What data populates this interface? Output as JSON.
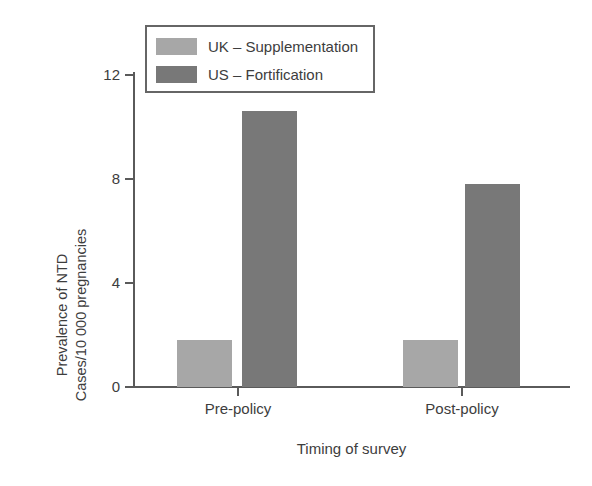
{
  "chart_data": {
    "type": "bar",
    "title": "",
    "xlabel": "Timing of survey",
    "ylabel": "Prevalence of NTD\nCases/10 000 pregnancies",
    "ylabel_line1": "Prevalence of NTD",
    "ylabel_line2": "Cases/10 000 pregnancies",
    "categories": [
      "Pre-policy",
      "Post-policy"
    ],
    "series": [
      {
        "name": "UK – Supplementation",
        "color": "#a7a7a7",
        "values": [
          1.8,
          1.8
        ]
      },
      {
        "name": "US – Fortification",
        "color": "#787878",
        "values": [
          10.6,
          7.8
        ]
      }
    ],
    "ylim": [
      0,
      12
    ],
    "yticks": [
      0,
      4,
      8,
      12
    ],
    "ytick_labels": [
      "0",
      "4",
      "8",
      "12"
    ],
    "grid": false,
    "legend_position": "top-left"
  },
  "legend": {
    "items": [
      {
        "label": "UK – Supplementation",
        "color": "#a7a7a7"
      },
      {
        "label": "US – Fortification",
        "color": "#787878"
      }
    ]
  },
  "axes": {
    "y_ticks": [
      "12",
      "8",
      "4",
      "0"
    ],
    "x_ticks": [
      "Pre-policy",
      "Post-policy"
    ],
    "y_title_line1": "Prevalence of NTD",
    "y_title_line2": "Cases/10 000 pregnancies",
    "x_title": "Timing of survey"
  },
  "colors": {
    "light_bar": "#a7a7a7",
    "dark_bar": "#787878",
    "axis": "#5a5a5a",
    "text": "#3d3d3d",
    "legend_border": "#666666",
    "background": "#ffffff"
  }
}
